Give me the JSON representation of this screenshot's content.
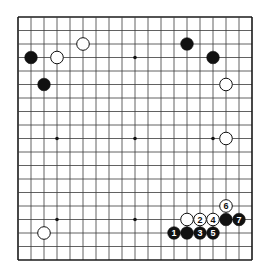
{
  "board": {
    "size": 19,
    "origin": {
      "x": 18,
      "y": 17
    },
    "spacing": {
      "x": 13.0,
      "y": 13.5
    },
    "line_color": "#3a3a3a",
    "border_color": "#1a1a1a",
    "background": "#ffffff",
    "star_points": [
      [
        3,
        3
      ],
      [
        9,
        3
      ],
      [
        15,
        3
      ],
      [
        3,
        9
      ],
      [
        9,
        9
      ],
      [
        15,
        9
      ],
      [
        3,
        15
      ],
      [
        9,
        15
      ],
      [
        15,
        15
      ]
    ]
  },
  "stones": [
    {
      "color": "black",
      "col": 1,
      "row": 3,
      "label": ""
    },
    {
      "color": "white",
      "col": 3,
      "row": 3,
      "label": ""
    },
    {
      "color": "white",
      "col": 5,
      "row": 2,
      "label": ""
    },
    {
      "color": "black",
      "col": 2,
      "row": 5,
      "label": ""
    },
    {
      "color": "black",
      "col": 13,
      "row": 2,
      "label": ""
    },
    {
      "color": "black",
      "col": 15,
      "row": 3,
      "label": ""
    },
    {
      "color": "white",
      "col": 16,
      "row": 5,
      "label": ""
    },
    {
      "color": "white",
      "col": 16,
      "row": 9,
      "label": ""
    },
    {
      "color": "white",
      "col": 2,
      "row": 16,
      "label": ""
    },
    {
      "color": "white",
      "col": 13,
      "row": 15,
      "label": ""
    },
    {
      "color": "white",
      "col": 14,
      "row": 15,
      "label": "2"
    },
    {
      "color": "white",
      "col": 15,
      "row": 15,
      "label": "4"
    },
    {
      "color": "black",
      "col": 16,
      "row": 15,
      "label": ""
    },
    {
      "color": "black",
      "col": 17,
      "row": 15,
      "label": "7"
    },
    {
      "color": "white",
      "col": 16,
      "row": 14,
      "label": "6"
    },
    {
      "color": "black",
      "col": 12,
      "row": 16,
      "label": "1"
    },
    {
      "color": "black",
      "col": 13,
      "row": 16,
      "label": ""
    },
    {
      "color": "black",
      "col": 14,
      "row": 16,
      "label": "3"
    },
    {
      "color": "black",
      "col": 15,
      "row": 16,
      "label": "5"
    }
  ]
}
